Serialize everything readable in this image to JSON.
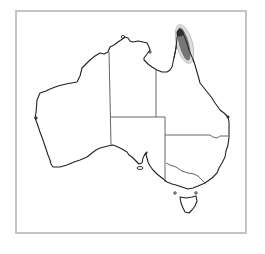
{
  "map": {
    "title": "Species distribution map - Australia",
    "region": "Australia",
    "highlighted_range": {
      "label": "Distribution range",
      "location": "Cape York Peninsula, north-east Queensland",
      "fill_color": "#5a5a5a",
      "halo_color": "#b8b8b8"
    },
    "colors": {
      "coastline": "#222222",
      "state_border": "#555555",
      "frame": "#c4c4c4",
      "background": "#ffffff"
    },
    "states_shown": [
      "Western Australia",
      "Northern Territory",
      "South Australia",
      "Queensland",
      "New South Wales",
      "Victoria",
      "Tasmania"
    ]
  }
}
